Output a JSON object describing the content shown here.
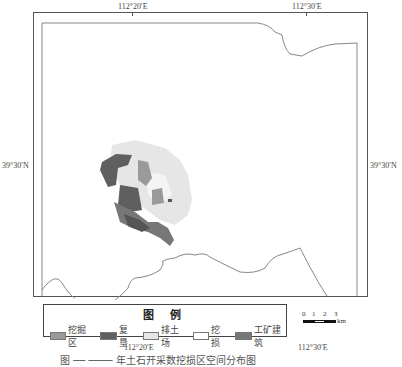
{
  "map": {
    "top_labels": [
      "112°20′E",
      "112°30′E"
    ],
    "bottom_labels": [
      "112°20′E",
      "112°30′E"
    ],
    "left_label": "39°30′N",
    "right_label": "39°30′N"
  },
  "legend": {
    "title": "图 例",
    "items": [
      {
        "label": "挖掘区",
        "color": "#9a9a9a"
      },
      {
        "label": "复垦",
        "color": "#5f5f5f"
      },
      {
        "label": "排土场",
        "color": "#e6e6e6"
      },
      {
        "label": "挖损",
        "color": "#ffffff"
      },
      {
        "label": "工矿建筑",
        "color": "#777777"
      }
    ]
  },
  "scale_bar": {
    "ticks": [
      "0",
      "1",
      "2",
      "3"
    ],
    "unit": "km"
  },
  "caption": "图 ── ──── 年土石开采数挖损区空间分布图"
}
